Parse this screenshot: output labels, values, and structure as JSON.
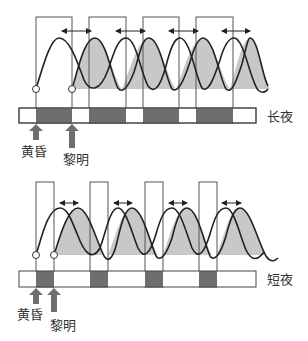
{
  "colors": {
    "line": "#2a2a2a",
    "night_fill": "#6e6e6e",
    "wave_fill": "#c8c8c8",
    "arrow_fill": "#6e6e6e",
    "box_stroke": "#555555"
  },
  "panels": [
    {
      "id": "long-night",
      "label": "长夜",
      "dusk_label": "黄昏",
      "dawn_label": "黎明"
    },
    {
      "id": "short-night",
      "label": "短夜",
      "dusk_label": "黄昏",
      "dawn_label": "黎明"
    }
  ]
}
